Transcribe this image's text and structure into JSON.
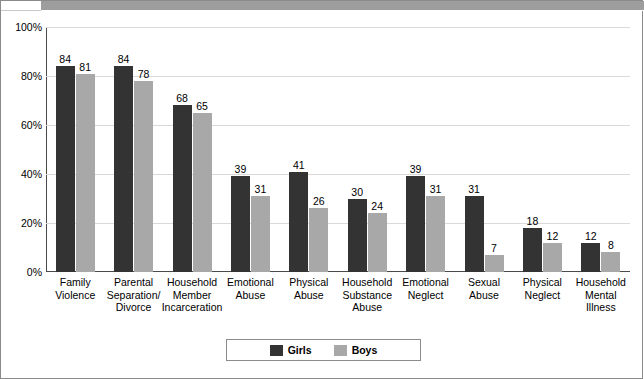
{
  "chart_data": {
    "type": "bar",
    "title": "",
    "xlabel": "",
    "ylabel": "",
    "ylim": [
      0,
      100
    ],
    "yticks": [
      0,
      20,
      40,
      60,
      80,
      100
    ],
    "ytick_labels": [
      "0%",
      "20%",
      "40%",
      "60%",
      "80%",
      "100%"
    ],
    "grid": true,
    "legend_position": "bottom-center",
    "categories": [
      "Family\nViolence",
      "Parental\nSeparation/\nDivorce",
      "Household\nMember\nIncarceration",
      "Emotional\nAbuse",
      "Physical\nAbuse",
      "Household\nSubstance\nAbuse",
      "Emotional\nNeglect",
      "Sexual\nAbuse",
      "Physical\nNeglect",
      "Household\nMental\nIllness"
    ],
    "category_lines": [
      [
        "Family",
        "Violence"
      ],
      [
        "Parental",
        "Separation/",
        "Divorce"
      ],
      [
        "Household",
        "Member",
        "Incarceration"
      ],
      [
        "Emotional",
        "Abuse"
      ],
      [
        "Physical",
        "Abuse"
      ],
      [
        "Household",
        "Substance",
        "Abuse"
      ],
      [
        "Emotional",
        "Neglect"
      ],
      [
        "Sexual",
        "Abuse"
      ],
      [
        "Physical",
        "Neglect"
      ],
      [
        "Household",
        "Mental",
        "Illness"
      ]
    ],
    "series": [
      {
        "name": "Girls",
        "color": "#333333",
        "values": [
          84,
          84,
          68,
          39,
          41,
          30,
          39,
          31,
          18,
          12
        ],
        "labels": [
          "84",
          "84",
          "68",
          "39",
          "41",
          "30",
          "39",
          "31",
          "18",
          "12"
        ]
      },
      {
        "name": "Boys",
        "color": "#a8a8a8",
        "values": [
          81,
          78,
          65,
          31,
          26,
          24,
          31,
          7,
          12,
          8
        ],
        "labels": [
          "81",
          "78",
          "65",
          "31",
          "26",
          "24",
          "31",
          "7",
          "12",
          "8"
        ]
      }
    ]
  },
  "legend": {
    "items": [
      {
        "label": "Girls"
      },
      {
        "label": "Boys"
      }
    ]
  }
}
